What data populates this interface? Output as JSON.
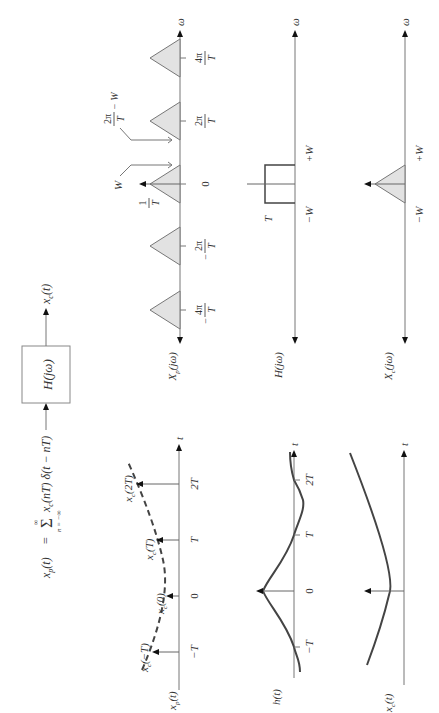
{
  "system": {
    "input_equation_lhs": "x",
    "input_equation_lhs_sub": "p",
    "input_equation_lhs_arg": "(t)",
    "input_equation_eq": "=",
    "input_equation_sigma": "Σ",
    "input_equation_sigma_upper": "∞",
    "input_equation_sigma_lower": "n = −∞",
    "input_equation_term": "x",
    "input_equation_term_sub": "c",
    "input_equation_term_rest": "(nT) δ(t − nT)",
    "box_label": "H(jω)",
    "output_label": "x",
    "output_label_sub": "c",
    "output_label_arg": "(t)"
  },
  "spectrum_xp": {
    "label": "X",
    "label_sub": "p",
    "label_arg": "(jω)",
    "axis_label": "ω",
    "ticks": [
      {
        "num": "4π",
        "den": "T",
        "sign": "−"
      },
      {
        "num": "2π",
        "den": "T",
        "sign": "−"
      },
      {
        "num": "0",
        "den": "",
        "sign": ""
      },
      {
        "num": "2π",
        "den": "T",
        "sign": ""
      },
      {
        "num": "4π",
        "den": "T",
        "sign": ""
      }
    ],
    "amplitude_num": "1",
    "amplitude_den": "T",
    "annotation_w": "W",
    "annotation_alias_num": "2π",
    "annotation_alias_den": "T",
    "annotation_alias_rest": "− W"
  },
  "filter_h": {
    "label": "H(jω)",
    "axis_label": "ω",
    "gain": "T",
    "cutoff_low": "−W",
    "cutoff_high": "+W"
  },
  "spectrum_xc": {
    "label": "X",
    "label_sub": "c",
    "label_arg": "(jω)",
    "axis_label": "ω",
    "edge_low": "−W",
    "edge_high": "+W"
  },
  "time_xp": {
    "label": "x",
    "label_sub": "p",
    "label_arg": "(t)",
    "axis_label": "t",
    "ticks": [
      "−T",
      "0",
      "T",
      "2T"
    ],
    "samples": [
      {
        "name": "x",
        "sub": "c",
        "arg": "(−T)"
      },
      {
        "name": "x",
        "sub": "c",
        "arg": "(0)"
      },
      {
        "name": "x",
        "sub": "c",
        "arg": "(T)"
      },
      {
        "name": "x",
        "sub": "c",
        "arg": "(2T)"
      }
    ]
  },
  "time_h": {
    "label": "h(t)",
    "axis_label": "t",
    "ticks": [
      "−T",
      "0",
      "T",
      "2T"
    ]
  },
  "time_xc": {
    "label": "x",
    "label_sub": "c",
    "label_arg": "(t)",
    "axis_label": "t"
  }
}
